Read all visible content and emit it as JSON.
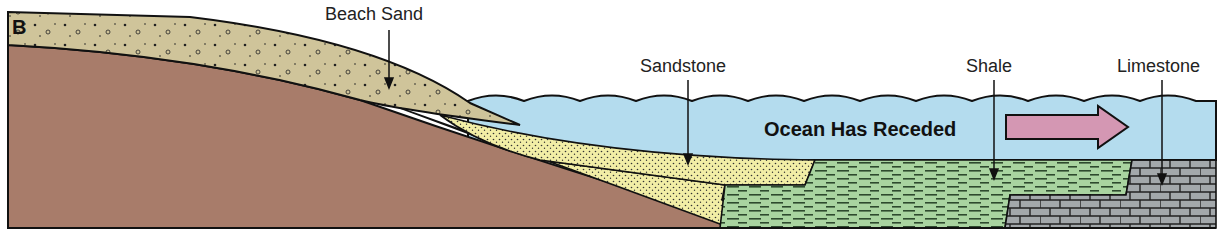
{
  "panel": {
    "letter": "B"
  },
  "labels": {
    "beach_sand": "Beach Sand",
    "sandstone": "Sandstone",
    "shale": "Shale",
    "limestone": "Limestone",
    "ocean": "Ocean Has Receded"
  },
  "colors": {
    "bedrock": "#a87c6a",
    "beach_sand": "#cfc49a",
    "sandstone": "#f2eea6",
    "shale": "#a9d4a0",
    "limestone": "#a3a8ab",
    "ocean": "#b4dcee",
    "arrow": "#d497b3",
    "outline": "#111111"
  }
}
